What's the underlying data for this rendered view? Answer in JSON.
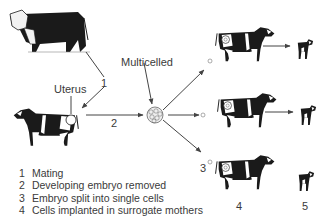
{
  "labels": {
    "uterus": "Uterus",
    "multicelled": "Multicelled",
    "step1": "1",
    "step2": "2",
    "step3": "3",
    "step4": "4",
    "step5": "5"
  },
  "legend": [
    {
      "num": "1",
      "text": "Mating"
    },
    {
      "num": "2",
      "text": "Developing embryo removed"
    },
    {
      "num": "3",
      "text": "Embryo split into single cells"
    },
    {
      "num": "4",
      "text": "Cells implanted in surrogate mothers"
    }
  ],
  "figures": {
    "bull": "hereford-bull",
    "donor_cow": "holstein-cow",
    "embryo": "multicelled-embryo",
    "surrogates": [
      "holstein-cow",
      "holstein-cow",
      "holstein-cow"
    ],
    "calves": [
      "calf",
      "calf",
      "calf"
    ]
  },
  "colors": {
    "ink": "#1a1a1a",
    "arrow": "#444444",
    "text": "#3a3a3a"
  }
}
